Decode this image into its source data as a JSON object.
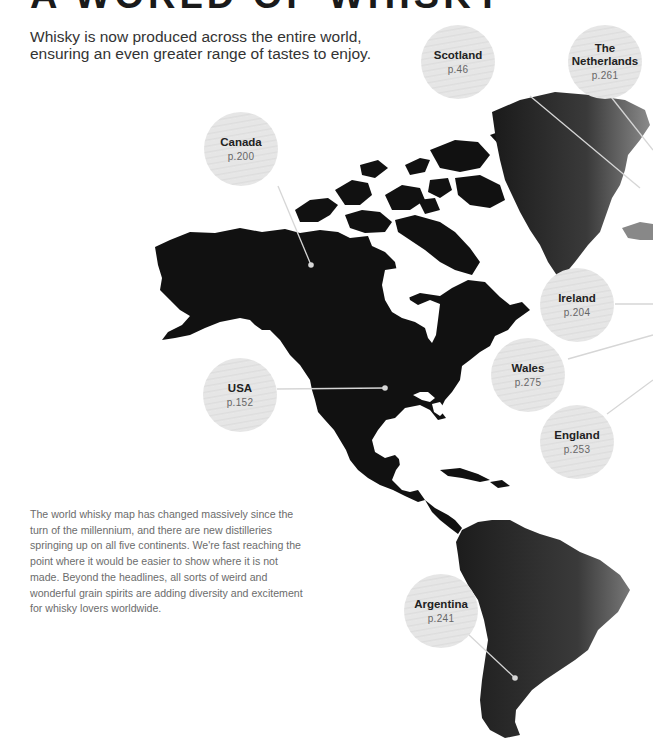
{
  "header": {
    "title": "A WORLD OF WHISKY",
    "subtitle": "Whisky is now produced across the entire world, ensuring an even greater range of tastes to enjoy."
  },
  "body_text": "The world whisky map has changed massively since the turn of the millennium, and there are new distilleries springing up on all five continents. We're fast reaching the point where it would be easier to show where it is not made. Beyond the headlines, all sorts of weird and wonderful grain spirits are adding diversity and excitement for whisky lovers worldwide.",
  "map": {
    "colors": {
      "land": "#111111",
      "bubble": "#e4e4e4",
      "leader_line": "#d8d8d8"
    },
    "regions": [
      {
        "name": "Scotland",
        "page": "p.46"
      },
      {
        "name": "The Netherlands",
        "page": "p.261"
      },
      {
        "name": "Canada",
        "page": "p.200"
      },
      {
        "name": "Ireland",
        "page": "p.204"
      },
      {
        "name": "Wales",
        "page": "p.275"
      },
      {
        "name": "USA",
        "page": "p.152"
      },
      {
        "name": "England",
        "page": "p.253"
      },
      {
        "name": "Argentina",
        "page": "p.241"
      }
    ]
  }
}
